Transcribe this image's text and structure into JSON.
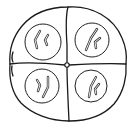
{
  "diagram": {
    "colors": {
      "stroke": "#1a1a1a",
      "background": "#ffffff"
    },
    "cells": [
      {
        "position": "top-left",
        "nucleus": {
          "cx": 43,
          "cy": 42,
          "r": 18
        },
        "chromosome_count": 2
      },
      {
        "position": "top-right",
        "nucleus": {
          "cx": 92,
          "cy": 40,
          "r": 17
        },
        "chromosome_count": 2
      },
      {
        "position": "bottom-left",
        "nucleus": {
          "cx": 42,
          "cy": 86,
          "r": 17
        },
        "chromosome_count": 2
      },
      {
        "position": "bottom-right",
        "nucleus": {
          "cx": 91,
          "cy": 86,
          "r": 16
        },
        "chromosome_count": 2
      }
    ]
  }
}
